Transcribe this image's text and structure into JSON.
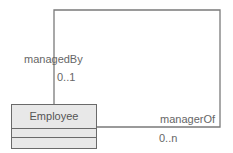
{
  "diagram": {
    "type": "uml-class-self-association",
    "colors": {
      "line": "#7a7a7a",
      "box_fill": "#e8e8e8",
      "box_border": "#6a6a6a",
      "text": "#666666"
    },
    "class": {
      "name": "Employee",
      "attributes": [],
      "operations": []
    },
    "association": {
      "end_source": {
        "role": "managedBy",
        "multiplicity": "0..1"
      },
      "end_target": {
        "role": "managerOf",
        "multiplicity": "0..n"
      }
    }
  }
}
